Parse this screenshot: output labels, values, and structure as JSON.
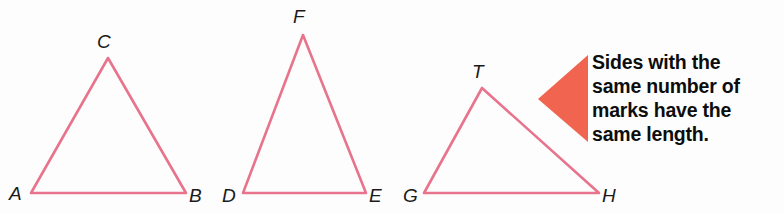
{
  "figure": {
    "background_color": "#fdfdfd",
    "stroke_color": "#e8738c",
    "pointer_color": "#f06450",
    "label_color": "#1a1a1a",
    "text_color": "#0d0d0d"
  },
  "triangles": [
    {
      "name": "triangle-abc",
      "vertices": [
        {
          "label": "A",
          "x": 31,
          "y": 193,
          "label_x": 9,
          "label_y": 200
        },
        {
          "label": "B",
          "x": 186,
          "y": 193,
          "label_x": 189,
          "label_y": 202
        },
        {
          "label": "C",
          "x": 108,
          "y": 58,
          "label_x": 97,
          "label_y": 48
        }
      ],
      "path": "M 31 193 L 186 193 L 108 58 Z"
    },
    {
      "name": "triangle-def",
      "vertices": [
        {
          "label": "D",
          "x": 243,
          "y": 193,
          "label_x": 222,
          "label_y": 202
        },
        {
          "label": "E",
          "x": 366,
          "y": 193,
          "label_x": 369,
          "label_y": 202
        },
        {
          "label": "F",
          "x": 303,
          "y": 35,
          "label_x": 293,
          "label_y": 23
        }
      ],
      "path": "M 243 193 L 366 193 L 303 35 Z"
    },
    {
      "name": "triangle-gth",
      "vertices": [
        {
          "label": "G",
          "x": 424,
          "y": 193,
          "label_x": 403,
          "label_y": 202
        },
        {
          "label": "H",
          "x": 599,
          "y": 193,
          "label_x": 602,
          "label_y": 202
        },
        {
          "label": "T",
          "x": 482,
          "y": 88,
          "label_x": 472,
          "label_y": 78
        }
      ],
      "path": "M 424 193 L 599 193 L 482 88 Z"
    }
  ],
  "pointer": {
    "name": "callout-pointer",
    "shape": "left-pointing-triangle",
    "path": "M 538 99 L 588 55 L 588 142 Z"
  },
  "callout": {
    "lines": [
      "Sides with the",
      "same number of",
      "marks have the",
      "same length."
    ],
    "full_text": "Sides with the same number of marks have the same length."
  }
}
